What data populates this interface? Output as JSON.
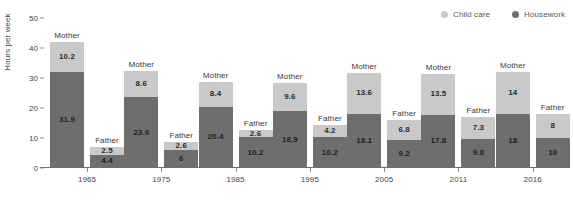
{
  "chart_data": {
    "type": "bar",
    "title": "",
    "subtitle": "",
    "xlabel": "",
    "ylabel": "Hours per week",
    "ylim": [
      0,
      50
    ],
    "yticks": [
      0,
      10,
      20,
      30,
      40,
      50
    ],
    "ytick_labels": [
      "0",
      "10",
      "20",
      "30",
      "40",
      "50"
    ],
    "grid": false,
    "stacked": true,
    "legend_position": "top-right",
    "categories": [
      "1965",
      "1975",
      "1985",
      "1995",
      "2005",
      "2011",
      "2016"
    ],
    "group_labels": [
      "Mother",
      "Father"
    ],
    "legend": [
      {
        "name": "Child care",
        "color": "#c9c9c9"
      },
      {
        "name": "Housework",
        "color": "#6e6e6e"
      }
    ],
    "series": [
      {
        "name": "Child care",
        "color": "#c9c9c9",
        "mother_values": [
          10.2,
          8.6,
          8.4,
          9.6,
          13.6,
          13.5,
          14
        ],
        "father_values": [
          2.5,
          2.6,
          2.6,
          4.2,
          6.8,
          7.3,
          8
        ]
      },
      {
        "name": "Housework",
        "color": "#6e6e6e",
        "mother_values": [
          31.9,
          23.6,
          20.4,
          18.9,
          18.1,
          17.8,
          18
        ],
        "father_values": [
          4.4,
          6,
          10.2,
          10.2,
          9.2,
          9.8,
          10
        ]
      }
    ],
    "groups": [
      {
        "category": "1965",
        "bars": [
          {
            "label": "Mother",
            "child_care": "10.2",
            "housework": "31.9",
            "child_care_value": 10.2,
            "housework_value": 31.9
          },
          {
            "label": "Father",
            "child_care": "2.5",
            "housework": "4.4",
            "child_care_value": 2.5,
            "housework_value": 4.4
          }
        ]
      },
      {
        "category": "1975",
        "bars": [
          {
            "label": "Mother",
            "child_care": "8.6",
            "housework": "23.6",
            "child_care_value": 8.6,
            "housework_value": 23.6
          },
          {
            "label": "Father",
            "child_care": "2.6",
            "housework": "6",
            "child_care_value": 2.6,
            "housework_value": 6
          }
        ]
      },
      {
        "category": "1985",
        "bars": [
          {
            "label": "Mother",
            "child_care": "8.4",
            "housework": "20.4",
            "child_care_value": 8.4,
            "housework_value": 20.4
          },
          {
            "label": "Father",
            "child_care": "2.6",
            "housework": "10.2",
            "child_care_value": 2.6,
            "housework_value": 10.2
          }
        ]
      },
      {
        "category": "1995",
        "bars": [
          {
            "label": "Mother",
            "child_care": "9.6",
            "housework": "18.9",
            "child_care_value": 9.6,
            "housework_value": 18.9
          },
          {
            "label": "Father",
            "child_care": "4.2",
            "housework": "10.2",
            "child_care_value": 4.2,
            "housework_value": 10.2
          }
        ]
      },
      {
        "category": "2005",
        "bars": [
          {
            "label": "Mother",
            "child_care": "13.6",
            "housework": "18.1",
            "child_care_value": 13.6,
            "housework_value": 18.1
          },
          {
            "label": "Father",
            "child_care": "6.8",
            "housework": "9.2",
            "child_care_value": 6.8,
            "housework_value": 9.2
          }
        ]
      },
      {
        "category": "2011",
        "bars": [
          {
            "label": "Mother",
            "child_care": "13.5",
            "housework": "17.8",
            "child_care_value": 13.5,
            "housework_value": 17.8
          },
          {
            "label": "Father",
            "child_care": "7.3",
            "housework": "9.8",
            "child_care_value": 7.3,
            "housework_value": 9.8
          }
        ]
      },
      {
        "category": "2016",
        "bars": [
          {
            "label": "Mother",
            "child_care": "14",
            "housework": "18",
            "child_care_value": 14,
            "housework_value": 18
          },
          {
            "label": "Father",
            "child_care": "8",
            "housework": "10",
            "child_care_value": 8,
            "housework_value": 10
          }
        ]
      }
    ]
  },
  "colors": {
    "child_care": "#c9c9c9",
    "housework": "#6e6e6e",
    "axis": "#6f6f6f",
    "text": "#444444",
    "background": "#ffffff"
  }
}
